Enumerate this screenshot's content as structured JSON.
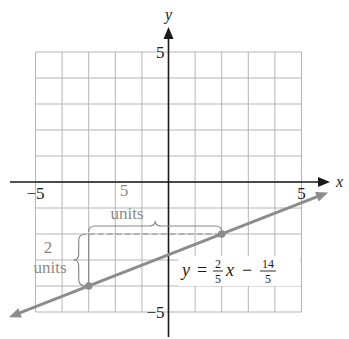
{
  "chart_data": {
    "type": "line",
    "title": "",
    "xlabel": "x",
    "ylabel": "y",
    "xlim": [
      -5,
      5
    ],
    "ylim": [
      -5,
      5
    ],
    "grid": true,
    "x_tick_labels": [
      {
        "value": -5,
        "label": "−5"
      },
      {
        "value": 5,
        "label": "5"
      }
    ],
    "y_tick_labels": [
      {
        "value": 5,
        "label": "5"
      },
      {
        "value": -5,
        "label": "−5"
      }
    ],
    "series": [
      {
        "name": "y = 2/5 x − 14/5",
        "slope": 0.4,
        "intercept": -2.8,
        "x_range": [
          -6,
          6
        ],
        "color": "#8c8c8c"
      }
    ],
    "points": [
      {
        "x": -3,
        "y": -4
      },
      {
        "x": 2,
        "y": -2
      }
    ],
    "equation": {
      "lhs": "y",
      "eq": "=",
      "frac1_num": "2",
      "frac1_den": "5",
      "var": "x",
      "minus": "−",
      "frac2_num": "14",
      "frac2_den": "5"
    },
    "annotations": {
      "run_value": "5",
      "run_unit": "units",
      "rise_value": "2",
      "rise_unit": "units"
    },
    "colors": {
      "axis": "#1a1a1a",
      "grid": "#b5b5b5",
      "line": "#8c8c8c",
      "annotation": "#8a8a8a"
    }
  }
}
